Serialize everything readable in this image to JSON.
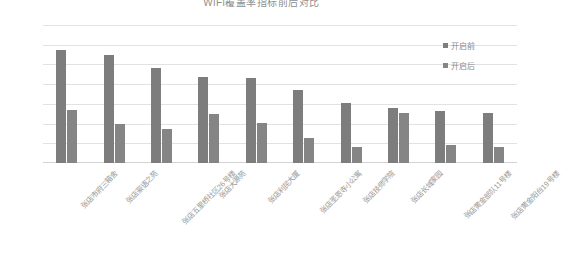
{
  "chart_data": {
    "type": "bar",
    "title": "WiFi覆盖率指标前后对比",
    "xlabel": "",
    "ylabel": "",
    "ylim": [
      0,
      35
    ],
    "ytick_labels": [
      "0.00%",
      "5.00%",
      "10.00%",
      "15.00%",
      "20.00%",
      "25.00%",
      "30.00%",
      "35.00%"
    ],
    "ytick_values": [
      0,
      5,
      10,
      15,
      20,
      25,
      30,
      35
    ],
    "grid": true,
    "legend_position": "right",
    "categories": [
      "张店市府三箱舍",
      "张店豪语之苑",
      "张店五里桥社区26号楼",
      "张店大源苑",
      "张店利民大厦",
      "张店圣恩寺小公寓",
      "张店技师学院",
      "张店长城家园",
      "张店黄金部队11号楼",
      "张店黄金阳台19号楼"
    ],
    "series": [
      {
        "name": "开启前",
        "color": "#7d7d7d",
        "values": [
          28.6,
          27.3,
          24.2,
          21.9,
          21.6,
          18.6,
          15.3,
          14.0,
          13.3,
          12.7
        ]
      },
      {
        "name": "开启后",
        "color": "#858585",
        "values": [
          13.4,
          9.9,
          8.7,
          12.5,
          10.2,
          6.3,
          4.1,
          12.6,
          4.5,
          4.0
        ]
      }
    ]
  },
  "colors": {
    "series1": "#7d7d7d",
    "series2": "#858585",
    "gridline": "#e2e2e2",
    "axis_text": "#8a8a8a",
    "title_text": "#8f8f8f",
    "background": "#ffffff"
  }
}
